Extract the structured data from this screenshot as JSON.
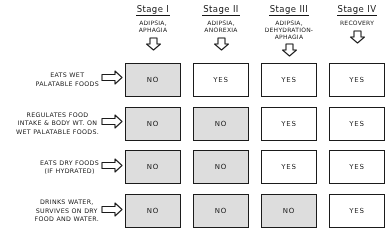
{
  "diagram": {
    "columns": [
      {
        "stage": "Stage I",
        "roman": "I",
        "description": "ADIPSIA,\nAPHAGIA",
        "arrow_icon": "down-block-arrow-icon"
      },
      {
        "stage": "Stage II",
        "roman": "II",
        "description": "ADIPSIA,\nANOREXIA",
        "arrow_icon": "down-block-arrow-icon"
      },
      {
        "stage": "Stage III",
        "roman": "III",
        "description": "ADIPSIA,\nDEHYDRATION-\nAPHAGIA",
        "arrow_icon": "down-block-arrow-icon"
      },
      {
        "stage": "Stage IV",
        "roman": "IV",
        "description": "RECOVERY",
        "arrow_icon": "down-block-arrow-icon"
      }
    ],
    "rows": [
      {
        "label": "EATS WET\nPALATABLE FOODS",
        "arrow_icon": "right-block-arrow-icon"
      },
      {
        "label": "REGULATES FOOD\nINTAKE & BODY WT. ON\nWET PALATABLE FOODS.",
        "arrow_icon": "right-block-arrow-icon"
      },
      {
        "label": "EATS DRY FOODS\n(IF HYDRATED)",
        "arrow_icon": "right-block-arrow-icon"
      },
      {
        "label": "DRINKS WATER,\nSURVIVES ON DRY\nFOOD AND WATER.",
        "arrow_icon": "right-block-arrow-icon"
      }
    ],
    "cells": [
      [
        {
          "value": "NO",
          "state": "negative"
        },
        {
          "value": "YES",
          "state": "positive"
        },
        {
          "value": "YES",
          "state": "positive"
        },
        {
          "value": "YES",
          "state": "positive"
        }
      ],
      [
        {
          "value": "NO",
          "state": "negative"
        },
        {
          "value": "NO",
          "state": "negative"
        },
        {
          "value": "YES",
          "state": "positive"
        },
        {
          "value": "YES",
          "state": "positive"
        }
      ],
      [
        {
          "value": "NO",
          "state": "negative"
        },
        {
          "value": "NO",
          "state": "negative"
        },
        {
          "value": "YES",
          "state": "positive"
        },
        {
          "value": "YES",
          "state": "positive"
        }
      ],
      [
        {
          "value": "NO",
          "state": "negative"
        },
        {
          "value": "NO",
          "state": "negative"
        },
        {
          "value": "NO",
          "state": "negative"
        },
        {
          "value": "YES",
          "state": "positive"
        }
      ]
    ],
    "colors": {
      "ink": "#1a1a1a",
      "negative_fill": "#d9d9d9",
      "positive_fill": "#ffffff",
      "background": "#ffffff"
    }
  }
}
